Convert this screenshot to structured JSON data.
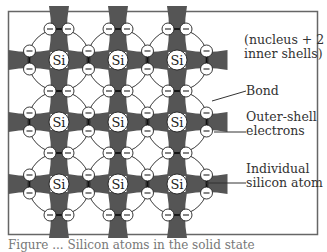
{
  "diagram": {
    "atom_symbol": "Si",
    "electron_symbol": "–",
    "grid": {
      "cols": 3,
      "rows": 3
    },
    "colors": {
      "bond_fill": "#555555",
      "stroke": "#222222",
      "border": "#666666",
      "background": "#ffffff"
    }
  },
  "labels": {
    "nucleus": "(nucleus + 2\ninner shells)",
    "bond": "Bond",
    "outer_shell": "Outer-shell\nelectrons",
    "atom": "Individual\nsilicon atom"
  },
  "caption": "Figure ... Silicon atoms in the solid state"
}
